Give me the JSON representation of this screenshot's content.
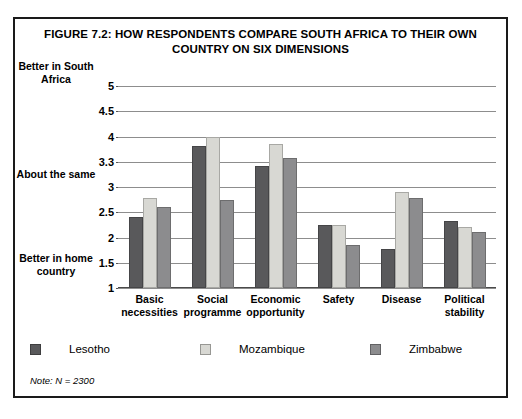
{
  "figure": {
    "title": "FIGURE 7.2: HOW RESPONDENTS COMPARE SOUTH AFRICA TO THEIR OWN COUNTRY ON SIX DIMENSIONS",
    "note": "Note: N = 2300",
    "axis_anchor_top": "Better in\nSouth\nAfrica",
    "axis_anchor_middle": "About\nthe\nsame",
    "axis_anchor_bottom": "Better in\nhome\ncountry"
  },
  "colors": {
    "series_lesotho": "#59595b",
    "series_mozambique": "#d8d8d3",
    "series_zimbabwe": "#8c8c8e",
    "frame": "#1a1a1a",
    "gridline": "#8d8d8d",
    "background": "#ffffff"
  },
  "legend": {
    "position": "bottom",
    "items": [
      {
        "label": "Lesotho",
        "color": "#59595b"
      },
      {
        "label": "Mozambique",
        "color": "#d8d8d3"
      },
      {
        "label": "Zimbabwe",
        "color": "#8c8c8e"
      }
    ]
  },
  "chart_data": {
    "type": "bar",
    "title": "FIGURE 7.2: HOW RESPONDENTS COMPARE SOUTH AFRICA TO THEIR OWN COUNTRY ON SIX DIMENSIONS",
    "xlabel": "",
    "ylabel": "",
    "ylim": [
      1,
      5
    ],
    "grid": true,
    "legend_position": "bottom",
    "tick_labels": [
      "5",
      "4.5",
      "4",
      "3.3",
      "3",
      "2.5",
      "2",
      "1.5",
      "1"
    ],
    "tick_values": [
      5,
      4.5,
      4,
      3.3,
      3,
      2.5,
      2,
      1.5,
      1
    ],
    "tick_note": "Tick labels are drawn at equal vertical spacing even though 3.3 breaks the 0.5 step.",
    "categories": [
      "Basic\nnecessities",
      "Social\nprogramme",
      "Economic\nopportunity",
      "Safety",
      "Disease",
      "Political\nstability"
    ],
    "series": [
      {
        "name": "Lesotho",
        "color": "#59595b",
        "values": [
          2.4,
          3.73,
          3.25,
          2.25,
          1.78,
          2.33
        ]
      },
      {
        "name": "Mozambique",
        "color": "#d8d8d3",
        "values": [
          2.78,
          4.0,
          3.8,
          2.25,
          2.9,
          2.2
        ]
      },
      {
        "name": "Zimbabwe",
        "color": "#8c8c8e",
        "values": [
          2.6,
          2.75,
          3.4,
          1.85,
          2.78,
          2.1
        ]
      }
    ]
  }
}
